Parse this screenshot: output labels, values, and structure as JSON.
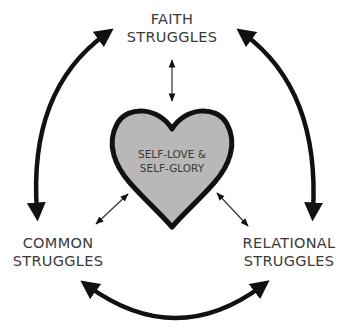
{
  "diagram": {
    "nodes": {
      "top": {
        "line1": "FAITH",
        "line2": "STRUGGLES"
      },
      "left": {
        "line1": "COMMON",
        "line2": "STRUGGLES"
      },
      "right": {
        "line1": "RELATIONAL",
        "line2": "STRUGGLES"
      },
      "center": {
        "line1": "SELF-LOVE &",
        "line2": "SELF-GLORY"
      }
    },
    "connections": [
      {
        "from": "top",
        "to": "center",
        "type": "double-arrow-thin"
      },
      {
        "from": "left",
        "to": "center",
        "type": "double-arrow-thin"
      },
      {
        "from": "right",
        "to": "center",
        "type": "double-arrow-thin"
      },
      {
        "from": "top",
        "to": "left",
        "type": "double-arrow-curved-thick"
      },
      {
        "from": "top",
        "to": "right",
        "type": "double-arrow-curved-thick"
      },
      {
        "from": "left",
        "to": "right",
        "type": "double-arrow-curved-thick"
      }
    ],
    "colors": {
      "heart_fill": "#b8b8b8",
      "heart_stroke": "#111111",
      "arrow": "#111111",
      "text": "#3a3a3a"
    }
  }
}
